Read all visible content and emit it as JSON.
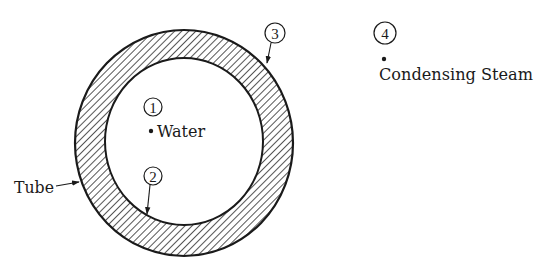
{
  "diagram": {
    "type": "cross-section",
    "colors": {
      "ink": "#1a1a1a",
      "background": "#ffffff",
      "hatch": "#2a2a2a"
    },
    "tube": {
      "label": "Tube",
      "outer": {
        "cx": 184,
        "cy": 143,
        "rx": 109,
        "ry": 113
      },
      "inner": {
        "cx": 184,
        "cy": 141.5,
        "rx": 79,
        "ry": 83.5
      }
    },
    "points": [
      {
        "id": "1",
        "number": "1",
        "label": "Water"
      },
      {
        "id": "2",
        "number": "2",
        "label": ""
      },
      {
        "id": "3",
        "number": "3",
        "label": ""
      },
      {
        "id": "4",
        "number": "4",
        "label": "Condensing Steam"
      }
    ]
  }
}
